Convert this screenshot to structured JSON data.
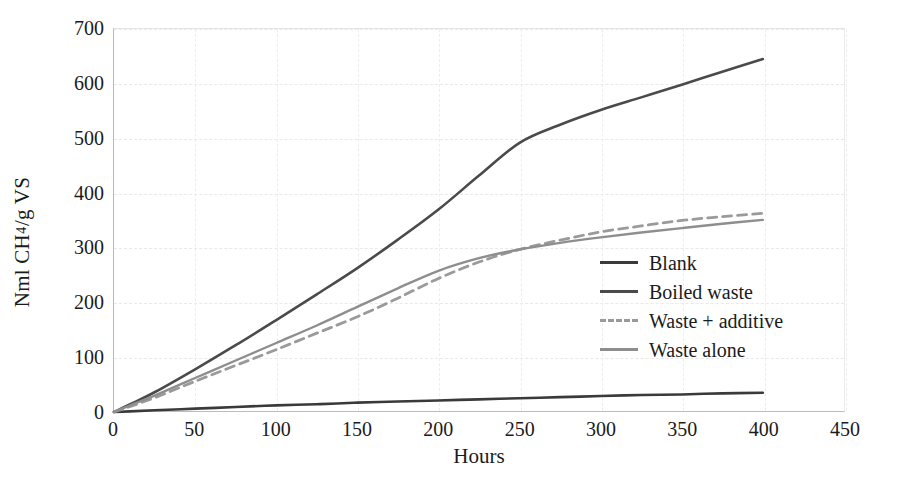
{
  "chart_data": {
    "type": "line",
    "title": "",
    "xlabel": "Hours",
    "ylabel_parts": {
      "pre": "Nml CH",
      "sub": "4",
      "post": "/g VS"
    },
    "ylabel_plain": "Nml CH4/g VS",
    "xlim": [
      0,
      450
    ],
    "ylim": [
      0,
      700
    ],
    "xticks": [
      0,
      50,
      100,
      150,
      200,
      250,
      300,
      350,
      400,
      450
    ],
    "yticks": [
      0,
      100,
      200,
      300,
      400,
      500,
      600,
      700
    ],
    "grid": true,
    "legend_position": "center-right",
    "series": [
      {
        "name": "Blank",
        "color": "#3a3a3a",
        "style": "solid",
        "width": 2.6,
        "x": [
          0,
          10,
          25,
          50,
          75,
          100,
          125,
          150,
          175,
          200,
          225,
          250,
          275,
          300,
          325,
          350,
          375,
          400
        ],
        "y": [
          0,
          1,
          3,
          6,
          9,
          12,
          14,
          17,
          19,
          21,
          23,
          25,
          27,
          29,
          31,
          32,
          34,
          35
        ]
      },
      {
        "name": "Boiled waste",
        "color": "#4a4a4a",
        "style": "solid",
        "width": 2.6,
        "x": [
          0,
          10,
          25,
          50,
          75,
          100,
          125,
          150,
          175,
          200,
          225,
          250,
          275,
          300,
          325,
          350,
          375,
          400
        ],
        "y": [
          0,
          14,
          36,
          78,
          122,
          168,
          215,
          263,
          315,
          370,
          432,
          492,
          525,
          552,
          575,
          598,
          622,
          645
        ]
      },
      {
        "name": "Waste + additive",
        "color": "#9a9a9a",
        "style": "dashed",
        "width": 2.8,
        "x": [
          0,
          10,
          25,
          50,
          75,
          100,
          125,
          150,
          175,
          200,
          225,
          250,
          275,
          300,
          325,
          350,
          375,
          400
        ],
        "y": [
          0,
          10,
          26,
          56,
          85,
          114,
          144,
          174,
          208,
          244,
          274,
          297,
          314,
          329,
          340,
          350,
          357,
          363
        ]
      },
      {
        "name": "Waste alone",
        "color": "#8e8e8e",
        "style": "solid",
        "width": 2.4,
        "x": [
          0,
          10,
          25,
          50,
          75,
          100,
          125,
          150,
          175,
          200,
          225,
          250,
          275,
          300,
          325,
          350,
          375,
          400
        ],
        "y": [
          0,
          12,
          30,
          62,
          94,
          126,
          158,
          192,
          226,
          258,
          281,
          297,
          309,
          319,
          328,
          336,
          344,
          351
        ]
      }
    ]
  },
  "legend": {
    "items": [
      {
        "label": "Blank"
      },
      {
        "label": "Boiled waste"
      },
      {
        "label": "Waste + additive"
      },
      {
        "label": "Waste alone"
      }
    ]
  }
}
